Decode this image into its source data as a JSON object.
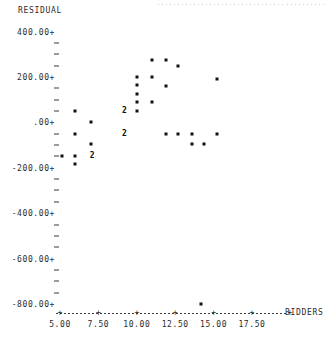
{
  "chart_data": {
    "type": "scatter",
    "title": "",
    "ylabel": "RESIDUAL",
    "xlabel": "BIDDERS",
    "xlim": [
      4.0,
      18.6
    ],
    "ylim": [
      -860,
      420
    ],
    "grid": false,
    "legend": false,
    "y_tick_labels": [
      "400.00+",
      "200.00+",
      ".00+",
      "-200.00+",
      "-400.00+",
      "-600.00+",
      "-800.00+"
    ],
    "y_tick_values": [
      400,
      200,
      0,
      -200,
      -400,
      -600,
      -800
    ],
    "y_minor_step": 50,
    "x_tick_labels": [
      "5.00",
      "7.50",
      "10.00",
      "12.50",
      "15.00",
      "17.50"
    ],
    "x_tick_values": [
      5.0,
      7.5,
      10.0,
      12.5,
      15.0,
      17.5
    ],
    "multiplicity_note": "A numeral plotted in place of a point indicates that many coincident observations",
    "points": [
      {
        "x": 5.1,
        "y": -150,
        "n": 1
      },
      {
        "x": 6.0,
        "y": 50,
        "n": 1
      },
      {
        "x": 6.0,
        "y": -50,
        "n": 1
      },
      {
        "x": 6.0,
        "y": -150,
        "n": 1
      },
      {
        "x": 6.0,
        "y": -185,
        "n": 1
      },
      {
        "x": 7.0,
        "y": 0,
        "n": 1
      },
      {
        "x": 7.0,
        "y": -95,
        "n": 1
      },
      {
        "x": 7.1,
        "y": -150,
        "n": 2
      },
      {
        "x": 9.2,
        "y": 50,
        "n": 2
      },
      {
        "x": 9.2,
        "y": -50,
        "n": 2
      },
      {
        "x": 10.0,
        "y": 200,
        "n": 1
      },
      {
        "x": 10.0,
        "y": 165,
        "n": 1
      },
      {
        "x": 10.0,
        "y": 125,
        "n": 1
      },
      {
        "x": 10.0,
        "y": 90,
        "n": 1
      },
      {
        "x": 10.0,
        "y": 50,
        "n": 1
      },
      {
        "x": 11.0,
        "y": 275,
        "n": 1
      },
      {
        "x": 11.0,
        "y": 200,
        "n": 1
      },
      {
        "x": 11.0,
        "y": 90,
        "n": 1
      },
      {
        "x": 11.9,
        "y": 275,
        "n": 1
      },
      {
        "x": 11.9,
        "y": 160,
        "n": 1
      },
      {
        "x": 11.9,
        "y": -50,
        "n": 1
      },
      {
        "x": 12.7,
        "y": 250,
        "n": 1
      },
      {
        "x": 12.7,
        "y": -50,
        "n": 1
      },
      {
        "x": 13.6,
        "y": -50,
        "n": 1
      },
      {
        "x": 13.6,
        "y": -95,
        "n": 1
      },
      {
        "x": 14.2,
        "y": -800,
        "n": 1
      },
      {
        "x": 14.4,
        "y": -95,
        "n": 1
      },
      {
        "x": 15.2,
        "y": 190,
        "n": 1
      },
      {
        "x": 15.2,
        "y": -50,
        "n": 1
      }
    ]
  }
}
